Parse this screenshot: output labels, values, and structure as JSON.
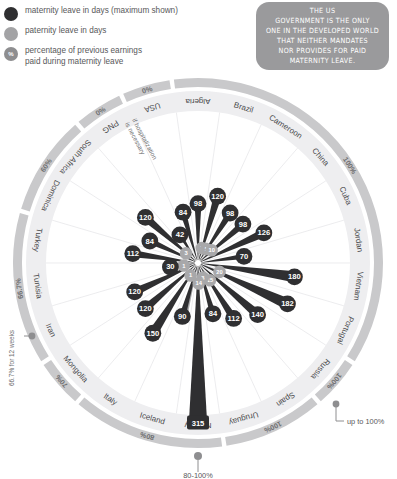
{
  "legend": {
    "items": [
      {
        "icon": "maternity-dot",
        "color": "#2f2f31",
        "label": "maternity leave in days (maximum shown)"
      },
      {
        "icon": "paternity-dot",
        "color": "#a3a3a5",
        "label": "paternity leave in days"
      },
      {
        "icon": "percent-dot",
        "color": "#8e8e90",
        "glyph": "%",
        "label": "percentage of previous earnings\npaid during maternity leave"
      }
    ]
  },
  "callout": {
    "text": "The US\ngovernment is the only\none in the developed world\nthat neither mandates\nnor provides for paid\nmaternity leave."
  },
  "annotations": {
    "png_note": "if hospitalization\nis necessary",
    "iran_note": "66.7% for 12 weeks",
    "russia_note": "up to 100%",
    "bottom_note": "80-100%"
  },
  "chart_data": {
    "type": "bar",
    "ylabel": "days of leave",
    "countries": [
      {
        "name": "USA",
        "maternity": 84,
        "paternity": null,
        "percent": "0%"
      },
      {
        "name": "Algeria",
        "maternity": 98,
        "paternity": null,
        "percent": "100%"
      },
      {
        "name": "Brazil",
        "maternity": 120,
        "paternity": 3,
        "percent": "100%"
      },
      {
        "name": "Cameroon",
        "maternity": 98,
        "paternity": 5,
        "percent": "100%"
      },
      {
        "name": "China",
        "maternity": 98,
        "paternity": 10,
        "percent": "100%"
      },
      {
        "name": "Cuba",
        "maternity": 126,
        "paternity": null,
        "percent": "100%"
      },
      {
        "name": "Jordan",
        "maternity": 70,
        "paternity": null,
        "percent": "100%"
      },
      {
        "name": "Vietnam",
        "maternity": 180,
        "paternity": null,
        "percent": "100%"
      },
      {
        "name": "Portugal",
        "maternity": 182,
        "paternity": 20,
        "percent": "100%"
      },
      {
        "name": "Russia",
        "maternity": 140,
        "paternity": null,
        "percent": "up to 100%"
      },
      {
        "name": "Spain",
        "maternity": 112,
        "paternity": 15,
        "percent": "100%"
      },
      {
        "name": "Uruguay",
        "maternity": 84,
        "paternity": 3,
        "percent": "100%"
      },
      {
        "name": "Norway",
        "maternity": 315,
        "paternity": 14,
        "percent": "80%"
      },
      {
        "name": "Iceland",
        "maternity": 90,
        "paternity": 90,
        "percent": "80%"
      },
      {
        "name": "Italy",
        "maternity": 150,
        "paternity": 1,
        "percent": "80%"
      },
      {
        "name": "Mongolia",
        "maternity": 120,
        "paternity": null,
        "percent": "70%"
      },
      {
        "name": "Iran",
        "maternity": 120,
        "paternity": null,
        "percent": "66.7%"
      },
      {
        "name": "Tunisia",
        "maternity": 30,
        "paternity": 1,
        "percent": "66.7%"
      },
      {
        "name": "Turkey",
        "maternity": 112,
        "paternity": null,
        "percent": "66.7%"
      },
      {
        "name": "Dominica",
        "maternity": 84,
        "paternity": null,
        "percent": "60%"
      },
      {
        "name": "South Africa",
        "maternity": 120,
        "paternity": 3,
        "percent": "60%"
      },
      {
        "name": "PNG",
        "maternity": 42,
        "paternity": null,
        "percent": "0%"
      }
    ],
    "percent_ticks": [
      "0%",
      "100%",
      "80%",
      "70%",
      "66.7%",
      "60%"
    ]
  }
}
